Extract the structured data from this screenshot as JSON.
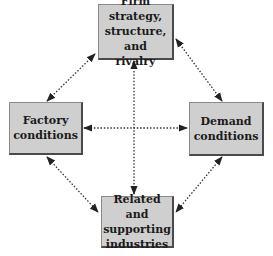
{
  "diagram": {
    "nodes": {
      "top": {
        "label": "Firm strategy, structure, and rivalry"
      },
      "left": {
        "label": "Factory conditions"
      },
      "right": {
        "label": "Demand conditions"
      },
      "bottom": {
        "label": "Related and supporting industries"
      }
    },
    "edges": [
      {
        "from": "top",
        "to": "left",
        "style": "dotted",
        "arrows": "both"
      },
      {
        "from": "top",
        "to": "right",
        "style": "dotted",
        "arrows": "both"
      },
      {
        "from": "left",
        "to": "bottom",
        "style": "dotted",
        "arrows": "both"
      },
      {
        "from": "right",
        "to": "bottom",
        "style": "dotted",
        "arrows": "both"
      },
      {
        "from": "top",
        "to": "bottom",
        "style": "dotted",
        "arrows": "both"
      },
      {
        "from": "left",
        "to": "right",
        "style": "dotted",
        "arrows": "both"
      }
    ],
    "colors": {
      "box_fill": "#cfcfcf",
      "box_border": "#4a4a4a",
      "line": "#333333"
    }
  }
}
